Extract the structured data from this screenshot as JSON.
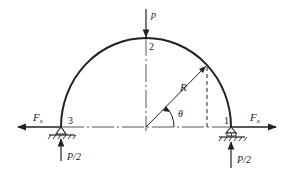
{
  "diagram": {
    "type": "semicircular-arch-free-body",
    "labels": {
      "load_top": "p",
      "point_2": "2",
      "point_1": "1",
      "point_3": "3",
      "radius": "R",
      "angle": "θ",
      "force_left": "F",
      "force_left_sub": "x",
      "force_right": "F",
      "force_right_sub": "x",
      "reaction_left": "P/2",
      "reaction_right": "P/2"
    },
    "supports": {
      "left": "pin",
      "right": "roller"
    },
    "colors": {
      "stroke": "#222222",
      "background": "#ffffff"
    }
  }
}
